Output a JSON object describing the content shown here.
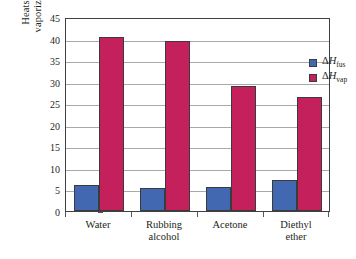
{
  "chart_data": {
    "type": "bar",
    "title": "",
    "xlabel": "",
    "ylabel": "Heats of fusion or vaporization (kJ/mol)",
    "ylabel_line1": "Heats of fusion or",
    "ylabel_line2": "vaporization (kJ/mol)",
    "ylim": [
      0,
      45
    ],
    "ytick_step": 5,
    "yticks": [
      "0",
      "5",
      "10",
      "15",
      "20",
      "25",
      "30",
      "35",
      "40",
      "45"
    ],
    "grid": "horizontal",
    "legend_position": "upper-right",
    "categories": [
      "Water",
      "Rubbing alcohol",
      "Acetone",
      "Diethyl ether"
    ],
    "category_lines": [
      [
        "Water"
      ],
      [
        "Rubbing",
        "alcohol"
      ],
      [
        "Acetone"
      ],
      [
        "Diethyl",
        "ether"
      ]
    ],
    "series": [
      {
        "name": "ΔH_fus",
        "label_delta": "Δ",
        "label_h": "H",
        "label_sub": "fus",
        "color": "#4168b0",
        "values": [
          6.0,
          5.4,
          5.7,
          7.2
        ]
      },
      {
        "name": "ΔH_vap",
        "label_delta": "Δ",
        "label_h": "H",
        "label_sub": "vap",
        "color": "#c4215c",
        "values": [
          40.7,
          39.9,
          29.3,
          26.8
        ]
      }
    ]
  },
  "legend": {
    "items": [
      {
        "delta": "Δ",
        "h": "H",
        "sub": "fus",
        "color": "#4168b0"
      },
      {
        "delta": "Δ",
        "h": "H",
        "sub": "vap",
        "color": "#c4215c"
      }
    ]
  },
  "colors": {
    "fusion_blue": "#4168b0",
    "vaporization_crimson": "#c4215c",
    "gridline": "#a7a9ac",
    "frame": "#414042",
    "text": "#231f20"
  }
}
